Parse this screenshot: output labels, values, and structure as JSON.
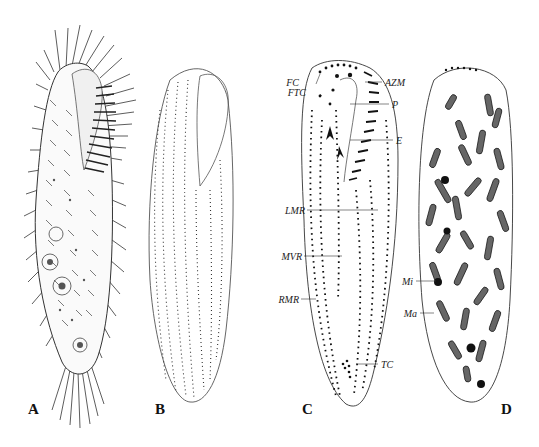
{
  "figure": {
    "panels": [
      {
        "id": "A",
        "label": "A",
        "description": "ciliate cell, live appearance with cirri"
      },
      {
        "id": "B",
        "label": "B",
        "description": "silver-stained cell, ventral kineties"
      },
      {
        "id": "C",
        "label": "C",
        "description": "infraciliature, ventral side"
      },
      {
        "id": "D",
        "label": "D",
        "description": "nuclear apparatus"
      }
    ],
    "annotations_C": {
      "FC": "FC",
      "FTC": "FTC",
      "AZM": "AZM",
      "P": "P",
      "E": "E",
      "LMR": "LMR",
      "MVR": "MVR",
      "RMR": "RMR",
      "TC": "TC"
    },
    "annotations_D": {
      "Mi": "Mi",
      "Ma": "Ma"
    },
    "colors": {
      "ink": "#222222",
      "background": "#ffffff"
    }
  }
}
